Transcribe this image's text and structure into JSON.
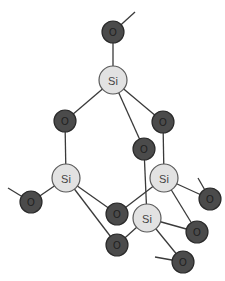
{
  "diagram": {
    "title": "",
    "colors": {
      "si_fill": "#e2e2e2",
      "o_fill": "#4b4b4b",
      "bond": "#3a3a3a"
    },
    "atoms": [
      {
        "id": "O1",
        "label": "O",
        "type": "O",
        "x": 113,
        "y": 32
      },
      {
        "id": "Si1",
        "label": "Si",
        "type": "Si",
        "x": 113,
        "y": 80
      },
      {
        "id": "O2",
        "label": "O",
        "type": "O",
        "x": 65,
        "y": 121
      },
      {
        "id": "O3",
        "label": "O",
        "type": "O",
        "x": 163,
        "y": 122
      },
      {
        "id": "O4",
        "label": "O",
        "type": "O",
        "x": 144,
        "y": 149
      },
      {
        "id": "Si2",
        "label": "Si",
        "type": "Si",
        "x": 66,
        "y": 178
      },
      {
        "id": "Si3",
        "label": "Si",
        "type": "Si",
        "x": 164,
        "y": 178
      },
      {
        "id": "O5",
        "label": "O",
        "type": "O",
        "x": 31,
        "y": 202
      },
      {
        "id": "O6",
        "label": "O",
        "type": "O",
        "x": 210,
        "y": 199
      },
      {
        "id": "O7",
        "label": "O",
        "type": "O",
        "x": 117,
        "y": 214
      },
      {
        "id": "Si4",
        "label": "Si",
        "type": "Si",
        "x": 147,
        "y": 218
      },
      {
        "id": "O8",
        "label": "O",
        "type": "O",
        "x": 197,
        "y": 232
      },
      {
        "id": "O9",
        "label": "O",
        "type": "O",
        "x": 117,
        "y": 245
      },
      {
        "id": "O10",
        "label": "O",
        "type": "O",
        "x": 183,
        "y": 262
      }
    ],
    "bonds": [
      [
        "O1",
        "Si1"
      ],
      [
        "Si1",
        "O2"
      ],
      [
        "Si1",
        "O3"
      ],
      [
        "Si1",
        "O4"
      ],
      [
        "O2",
        "Si2"
      ],
      [
        "O3",
        "Si3"
      ],
      [
        "O4",
        "Si4"
      ],
      [
        "Si2",
        "O5"
      ],
      [
        "Si2",
        "O7"
      ],
      [
        "Si2",
        "O9"
      ],
      [
        "Si3",
        "O6"
      ],
      [
        "Si3",
        "O7"
      ],
      [
        "Si3",
        "O8"
      ],
      [
        "Si4",
        "O8"
      ],
      [
        "Si4",
        "O9"
      ],
      [
        "Si4",
        "O10"
      ]
    ],
    "stubs": [
      {
        "from": "O1",
        "x2": 135,
        "y2": 12
      },
      {
        "from": "O5",
        "x2": 8,
        "y2": 188
      },
      {
        "from": "O6",
        "x2": 198,
        "y2": 178
      },
      {
        "from": "O10",
        "x2": 155,
        "y2": 257
      }
    ]
  }
}
